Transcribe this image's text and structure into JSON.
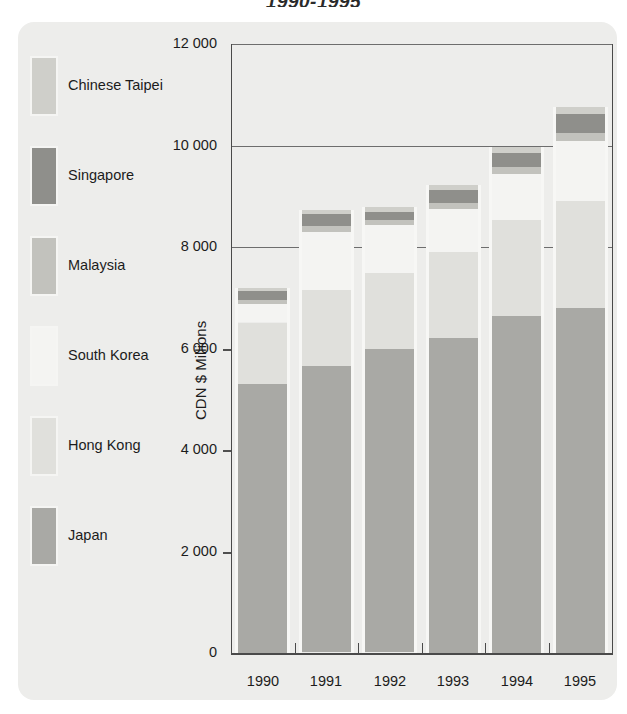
{
  "title": "1990-1995",
  "axis": {
    "ylabel": "CDN $ Millions",
    "yticks": [
      "0",
      "2 000",
      "4 000",
      "6 000",
      "8 000",
      "10 000",
      "12 000"
    ],
    "ytick_values": [
      0,
      2000,
      4000,
      6000,
      8000,
      10000,
      12000
    ],
    "xticks": [
      "1990",
      "1991",
      "1992",
      "1993",
      "1994",
      "1995"
    ]
  },
  "colors": {
    "panel": "#ededeb",
    "japan": "#a9a9a5",
    "hong_kong": "#e0e0dc",
    "south_korea": "#f4f4f2",
    "malaysia": "#c2c2bd",
    "singapore": "#8f8f8b",
    "chinese_taipei": "#cfcfca",
    "gridline": "#6d6d6d",
    "axis": "#4a4a4a",
    "text": "#1c1c1c"
  },
  "legend": {
    "items": [
      {
        "label": "Chinese Taipei",
        "color_key": "chinese_taipei"
      },
      {
        "label": "Singapore",
        "color_key": "singapore"
      },
      {
        "label": "Malaysia",
        "color_key": "malaysia"
      },
      {
        "label": "South Korea",
        "color_key": "south_korea"
      },
      {
        "label": "Hong Kong",
        "color_key": "hong_kong"
      },
      {
        "label": "Japan",
        "color_key": "japan"
      }
    ]
  },
  "chart_data": {
    "type": "bar",
    "subtype": "stacked",
    "title": "1990-1995",
    "xlabel": "",
    "ylabel": "CDN $ Millions",
    "ylim": [
      0,
      12000
    ],
    "grid": true,
    "legend_position": "left",
    "categories": [
      "1990",
      "1991",
      "1992",
      "1993",
      "1994",
      "1995"
    ],
    "series": [
      {
        "name": "Japan",
        "color_key": "japan",
        "values": [
          5320,
          5640,
          5980,
          6200,
          6650,
          6800
        ]
      },
      {
        "name": "Hong Kong",
        "color_key": "hong_kong",
        "values": [
          1200,
          1500,
          1500,
          1700,
          1900,
          2100
        ]
      },
      {
        "name": "South Korea",
        "color_key": "south_korea",
        "values": [
          380,
          1150,
          950,
          850,
          900,
          1200
        ]
      },
      {
        "name": "Malaysia",
        "color_key": "malaysia",
        "values": [
          70,
          120,
          100,
          120,
          130,
          150
        ]
      },
      {
        "name": "Singapore",
        "color_key": "singapore",
        "values": [
          170,
          230,
          160,
          250,
          280,
          380
        ]
      },
      {
        "name": "Chinese Taipei",
        "color_key": "chinese_taipei",
        "values": [
          60,
          80,
          90,
          100,
          120,
          130
        ]
      }
    ],
    "totals": [
      7200,
      8720,
      8780,
      9220,
      9980,
      10760
    ]
  }
}
